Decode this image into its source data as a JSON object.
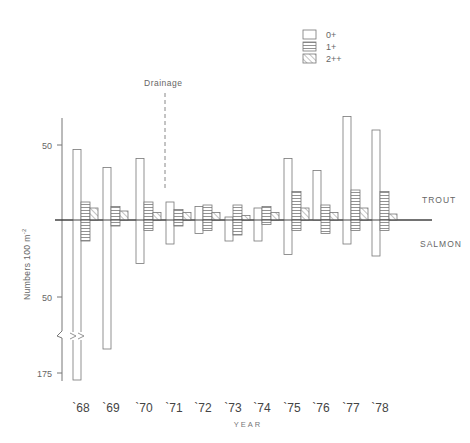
{
  "chart_data": {
    "type": "bar",
    "title": "",
    "xlabel": "YEAR",
    "ylabel": "Numbers 100 m-2",
    "categories": [
      "`68",
      "`69",
      "`70",
      "`71",
      "`72",
      "`73",
      "`74",
      "`75",
      "`76",
      "`77",
      "`78"
    ],
    "upper_label": "TROUT",
    "lower_label": "SALMON",
    "annotation": {
      "text": "Drainage",
      "between": [
        "`70",
        "`71"
      ]
    },
    "y_ticks_upper": [
      50
    ],
    "y_ticks_lower": [
      50,
      175
    ],
    "axis_break": true,
    "legend": [
      {
        "name": "0+",
        "pattern": "open"
      },
      {
        "name": "1+",
        "pattern": "horizontal"
      },
      {
        "name": "2++",
        "pattern": "diagonal"
      }
    ],
    "series": [
      {
        "name": "0+",
        "species": "trout",
        "values": [
          47,
          35,
          41,
          12,
          9,
          2,
          8,
          41,
          33,
          69,
          60
        ]
      },
      {
        "name": "0+",
        "species": "salmon",
        "values": [
          175,
          86,
          29,
          16,
          9,
          14,
          14,
          23,
          0,
          16,
          24
        ]
      },
      {
        "name": "1+",
        "species": "trout",
        "values": [
          12,
          9,
          12,
          7,
          10,
          10,
          9,
          19,
          10,
          20,
          19
        ]
      },
      {
        "name": "1+",
        "species": "salmon",
        "values": [
          14,
          4,
          7,
          4,
          7,
          10,
          3,
          7,
          9,
          7,
          7
        ]
      },
      {
        "name": "2++",
        "species": "trout",
        "values": [
          8,
          6,
          5,
          5,
          5,
          3,
          5,
          8,
          5,
          8,
          4
        ]
      },
      {
        "name": "2++",
        "species": "salmon",
        "values": [
          0,
          0,
          0,
          0,
          0,
          0,
          0,
          0,
          0,
          0,
          0
        ]
      }
    ]
  },
  "labels": {
    "legend_0": "0+",
    "legend_1": "1+",
    "legend_2": "2++",
    "drainage": "Drainage",
    "trout": "TROUT",
    "salmon": "SALMON",
    "ylabel": "Numbers  100 m",
    "ylabel_sup": "-2",
    "xlabel": "YEAR",
    "tick_upper_50": "50",
    "tick_lower_50": "50",
    "tick_175": "175"
  }
}
